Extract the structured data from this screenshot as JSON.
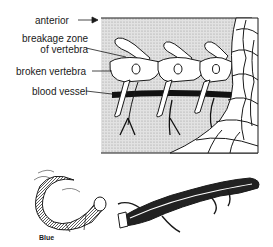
{
  "diagram": {
    "labels": {
      "anterior": "anterior",
      "breakage_zone_line1": "breakage zone",
      "breakage_zone_line2": "of vertebra",
      "broken_vertebra": "broken vertebra",
      "blood_vessel": "blood vessel",
      "blue": "Blue"
    },
    "colors": {
      "ink": "#1a1a1a",
      "background_stipple": "#d9d9d9",
      "paper": "#ffffff"
    },
    "components": [
      "vertebral-column-cross-section",
      "scale-pattern",
      "detached-tail",
      "lizard-body"
    ]
  }
}
